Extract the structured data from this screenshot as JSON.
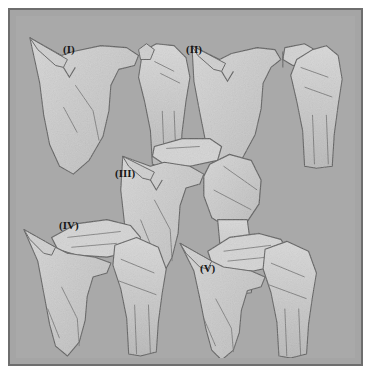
{
  "figure": {
    "panel_count": 5,
    "style": "grayscale pencil-shaded medical line drawing",
    "colors": {
      "page_background": "#ffffff",
      "frame_border": "#6e6e6e",
      "plate_background": "#a9a9a9",
      "outer_background": "#a5a5a5",
      "bone_fill": "#c9c9c9",
      "bone_fill_light": "#d4d4d4",
      "bone_outline": "#5d5d5d",
      "label_color": "#161616"
    },
    "panels": [
      {
        "id": "I",
        "label": "(I)",
        "region": "top-left",
        "view": "scapula with acromion and humeral head, minimal displacement"
      },
      {
        "id": "II",
        "label": "(II)",
        "region": "top-right",
        "view": "scapula with separated superior fragment above humeral head"
      },
      {
        "id": "III",
        "label": "(III)",
        "region": "middle-center",
        "view": "scapula with detached free-floating fragment and rotated humeral head"
      },
      {
        "id": "IV",
        "label": "(IV)",
        "region": "bottom-left",
        "view": "scapula with overriding fragment resting on humeral head"
      },
      {
        "id": "V",
        "label": "(V)",
        "region": "bottom-right",
        "view": "scapula with fragment fully displaced over the humeral head"
      }
    ]
  }
}
